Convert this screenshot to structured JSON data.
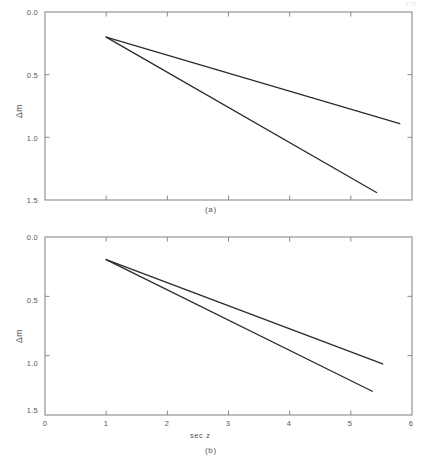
{
  "page": {
    "corner_mark": "573"
  },
  "figure": {
    "panel_a_caption": "(a)",
    "panel_b_caption": "(b)"
  },
  "chart_data": [
    {
      "type": "line",
      "panel": "a",
      "title": "(a)",
      "xlabel": "",
      "ylabel": "Δm",
      "xlim": [
        0,
        6
      ],
      "ylim": [
        1.5,
        0.0
      ],
      "y_inverted": true,
      "grid": false,
      "legend": "none",
      "xticks": [
        0,
        1,
        2,
        3,
        4,
        5,
        6
      ],
      "xticklabels": [
        "",
        "",
        "",
        "",
        "",
        "",
        ""
      ],
      "yticks": [
        0.0,
        0.5,
        1.0,
        1.5
      ],
      "yticklabels": [
        "0.0",
        "0.5",
        "1.0",
        "1.5"
      ],
      "series": [
        {
          "name": "upper",
          "x": [
            1.0,
            5.8
          ],
          "y": [
            0.2,
            0.89
          ]
        },
        {
          "name": "lower",
          "x": [
            1.0,
            5.42
          ],
          "y": [
            0.2,
            1.44
          ]
        }
      ]
    },
    {
      "type": "line",
      "panel": "b",
      "title": "(b)",
      "xlabel": "sec z",
      "ylabel": "Δm",
      "xlim": [
        0,
        6
      ],
      "ylim": [
        1.5,
        0.0
      ],
      "y_inverted": true,
      "grid": false,
      "legend": "none",
      "xticks": [
        0,
        1,
        2,
        3,
        4,
        5,
        6
      ],
      "xticklabels": [
        "0",
        "1",
        "2",
        "3",
        "4",
        "5",
        "6"
      ],
      "yticks": [
        0.0,
        0.5,
        1.0,
        1.5
      ],
      "yticklabels": [
        "0.0",
        "0.5",
        "1.0",
        "1.5"
      ],
      "series": [
        {
          "name": "upper",
          "x": [
            1.0,
            5.52
          ],
          "y": [
            0.19,
            1.07
          ]
        },
        {
          "name": "lower",
          "x": [
            1.0,
            5.35
          ],
          "y": [
            0.19,
            1.3
          ]
        }
      ]
    }
  ],
  "axis_labels": {
    "y_title": "Δm",
    "x_title": "sec z",
    "y_ticks": [
      "0.0",
      "0.5",
      "1.0",
      "1.5"
    ],
    "x_ticks": [
      "0",
      "1",
      "2",
      "3",
      "4",
      "5",
      "6"
    ]
  },
  "colors": {
    "line": "#2b2b2b",
    "frame": "#8a8a8a",
    "text": "#555555",
    "background": "#ffffff"
  }
}
